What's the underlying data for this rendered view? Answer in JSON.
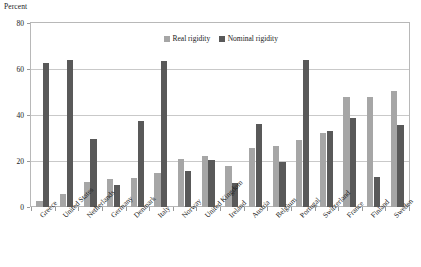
{
  "chart_data": {
    "type": "bar",
    "title": "",
    "subtitle": "",
    "xlabel": "",
    "ylabel": "Percent",
    "ylim": [
      0,
      80
    ],
    "yticks": [
      0,
      20,
      40,
      60,
      80
    ],
    "grid": true,
    "legend_position": "top-center",
    "categories": [
      "Greece",
      "United States",
      "Netherlands",
      "Germany",
      "Denmark",
      "Italy",
      "Norway",
      "United Kingdom",
      "Ireland",
      "Austria",
      "Belgium",
      "Portugal",
      "Switzerland",
      "France",
      "Finland",
      "Sweden"
    ],
    "series": [
      {
        "name": "Real rigidity",
        "color": "#a6a6a6",
        "values": [
          2.5,
          5.5,
          11.0,
          12.0,
          12.5,
          15.0,
          21.0,
          22.0,
          18.0,
          25.5,
          26.5,
          29.0,
          32.0,
          48.0,
          48.0,
          50.5
        ]
      },
      {
        "name": "Nominal rigidity",
        "color": "#595959",
        "values": [
          62.5,
          64.0,
          29.5,
          9.5,
          37.5,
          63.5,
          15.5,
          20.5,
          10.5,
          36.0,
          19.5,
          64.0,
          33.0,
          38.5,
          13.0,
          35.5
        ]
      }
    ]
  },
  "legend": {
    "items": [
      {
        "label": "Real rigidity",
        "swatch": "real"
      },
      {
        "label": "Nominal rigidity",
        "swatch": "nominal"
      }
    ]
  },
  "axis": {
    "y_title": "Percent"
  }
}
